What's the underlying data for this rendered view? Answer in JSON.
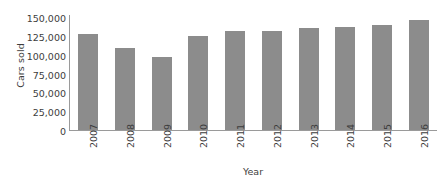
{
  "chart_data": {
    "type": "bar",
    "title": "",
    "xlabel": "Year",
    "ylabel": "Cars sold",
    "categories": [
      "2007",
      "2008",
      "2009",
      "2010",
      "2011",
      "2012",
      "2013",
      "2014",
      "2015",
      "2016"
    ],
    "values": [
      129000,
      110000,
      98000,
      126000,
      133000,
      133000,
      136000,
      138000,
      141000,
      147000
    ],
    "ylim": [
      0,
      150000
    ],
    "ytick_labels": [
      "0",
      "25,000",
      "50,000",
      "75,000",
      "100,000",
      "125,000",
      "150,000"
    ],
    "ytick_values": [
      0,
      25000,
      50000,
      75000,
      100000,
      125000,
      150000
    ],
    "grid": false,
    "legend": false,
    "series": [
      {
        "name": "Cars sold",
        "color": "#8c8c8c",
        "values": [
          129000,
          110000,
          98000,
          126000,
          133000,
          133000,
          136000,
          138000,
          141000,
          147000
        ]
      }
    ]
  },
  "colors": {
    "bar": "#8c8c8c",
    "axis": "#9a9a9a",
    "text": "#3d3d3d",
    "background": "#ffffff"
  }
}
